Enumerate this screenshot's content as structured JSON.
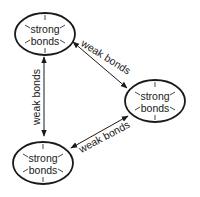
{
  "nodes": [
    {
      "id": "top-left",
      "line1": "strong",
      "line2": "bonds"
    },
    {
      "id": "right",
      "line1": "strong",
      "line2": "bonds"
    },
    {
      "id": "bottom-left",
      "line1": "strong",
      "line2": "bonds"
    }
  ],
  "edges": [
    {
      "from": "top-left",
      "to": "right",
      "label": "weak bonds",
      "bidirectional": true
    },
    {
      "from": "top-left",
      "to": "bottom-left",
      "label": "weak bonds",
      "bidirectional": true
    },
    {
      "from": "bottom-left",
      "to": "right",
      "label": "weak bonds",
      "bidirectional": true
    }
  ]
}
